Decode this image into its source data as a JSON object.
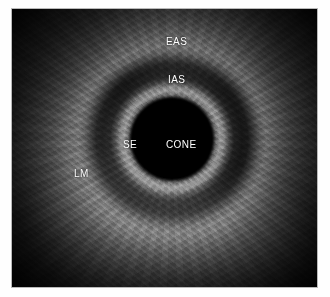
{
  "figure": {
    "modality": "endoanal-ultrasound",
    "view": "axial-cross-section",
    "background_color": "#ffffff",
    "plate_color": "#000000",
    "label_color": "#ffffff",
    "border_color": "#b9b9b9"
  },
  "annotations": [
    {
      "id": "eas",
      "label": "EAS",
      "meaning": "external anal sphincter",
      "x": 168,
      "y": 34
    },
    {
      "id": "ias",
      "label": "IAS",
      "meaning": "internal anal sphincter",
      "x": 170,
      "y": 72
    },
    {
      "id": "cone",
      "label": "CONE",
      "meaning": "transducer cone",
      "x": 172,
      "y": 137
    },
    {
      "id": "se",
      "label": "SE",
      "meaning": "subepithelial layer",
      "x": 120,
      "y": 137
    },
    {
      "id": "lm",
      "label": "LM",
      "meaning": "longitudinal muscle",
      "x": 72,
      "y": 166
    }
  ],
  "geometry": {
    "center_x": 172,
    "center_y": 139,
    "cone_radius": 40,
    "plate_left": 11,
    "plate_top": 8,
    "plate_width": 307,
    "plate_height": 280
  }
}
